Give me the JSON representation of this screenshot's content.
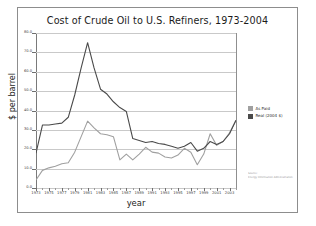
{
  "figure": {
    "title": "Cost of Crude Oil to U.S. Refiners, 1973-2004",
    "xlabel": "year",
    "ylabel": "$ per barrel"
  },
  "legend": {
    "items": [
      {
        "label": "As Paid",
        "color": "#a0a0a0"
      },
      {
        "label": "Real (2004 $)",
        "color": "#4a4a4a"
      }
    ]
  },
  "source": {
    "line1": "Source:",
    "line2": "Energy Information Administration"
  },
  "chart_data": {
    "type": "line",
    "title": "Cost of Crude Oil to U.S. Refiners, 1973-2004",
    "xlabel": "year",
    "ylabel": "$ per barrel",
    "xlim": [
      1973,
      2004
    ],
    "ylim": [
      0,
      80
    ],
    "grid": true,
    "legend_position": "right",
    "ytick_labels": [
      "0.0",
      "10.0",
      "20.0",
      "30.0",
      "40.0",
      "50.0",
      "60.0",
      "70.0",
      "80.0"
    ],
    "ytick_values": [
      0,
      10,
      20,
      30,
      40,
      50,
      60,
      70,
      80
    ],
    "xtick_labels": [
      "1973",
      "1975",
      "1977",
      "1979",
      "1981",
      "1983",
      "1985",
      "1987",
      "1989",
      "1991",
      "1993",
      "1995",
      "1997",
      "1999",
      "2001",
      "2003"
    ],
    "xtick_values": [
      1973,
      1975,
      1977,
      1979,
      1981,
      1983,
      1985,
      1987,
      1989,
      1991,
      1993,
      1995,
      1997,
      1999,
      2001,
      2003
    ],
    "x": [
      1973,
      1974,
      1975,
      1976,
      1977,
      1978,
      1979,
      1980,
      1981,
      1982,
      1983,
      1984,
      1985,
      1986,
      1987,
      1988,
      1989,
      1990,
      1991,
      1992,
      1993,
      1994,
      1995,
      1996,
      1997,
      1998,
      1999,
      2000,
      2001,
      2002,
      2003,
      2004
    ],
    "series": [
      {
        "name": "As Paid",
        "color": "#a0a0a0",
        "values": [
          4.2,
          9.1,
          10.4,
          11.2,
          12.5,
          13.0,
          18.5,
          26.5,
          34.5,
          31.0,
          28.0,
          27.5,
          26.5,
          14.5,
          17.5,
          14.5,
          17.5,
          21.0,
          18.5,
          18.0,
          16.0,
          15.5,
          17.0,
          20.5,
          18.5,
          12.0,
          17.5,
          28.0,
          22.0,
          24.0,
          28.5,
          35.0
        ]
      },
      {
        "name": "Real (2004 $)",
        "color": "#4a4a4a",
        "values": [
          18.0,
          32.5,
          32.5,
          33.0,
          33.5,
          36.5,
          48.0,
          62.0,
          75.0,
          62.0,
          51.0,
          48.5,
          44.5,
          41.5,
          39.5,
          25.5,
          24.5,
          23.5,
          24.0,
          23.0,
          22.5,
          21.5,
          20.5,
          21.5,
          23.5,
          19.0,
          20.5,
          24.0,
          22.5,
          24.0,
          28.0,
          35.0
        ]
      }
    ]
  }
}
